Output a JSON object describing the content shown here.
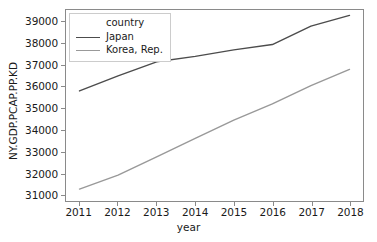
{
  "chart_data": {
    "type": "line",
    "title": "",
    "xlabel": "year",
    "ylabel": "NY.GDP.PCAP.PP.KD",
    "x": [
      2011,
      2012,
      2013,
      2014,
      2015,
      2016,
      2017,
      2018
    ],
    "xlim": [
      2010.65,
      2018.35
    ],
    "ylim": [
      30700,
      39550
    ],
    "xticks": [
      2011,
      2012,
      2013,
      2014,
      2015,
      2016,
      2017,
      2018
    ],
    "xtick_labels": [
      "2011",
      "2012",
      "2013",
      "2014",
      "2015",
      "2016",
      "2017",
      "2018"
    ],
    "yticks": [
      31000,
      32000,
      33000,
      34000,
      35000,
      36000,
      37000,
      38000,
      39000
    ],
    "ytick_labels": [
      "31000",
      "32000",
      "33000",
      "34000",
      "35000",
      "36000",
      "37000",
      "38000",
      "39000"
    ],
    "grid": false,
    "legend_position": "upper left",
    "legend_title": "country",
    "series": [
      {
        "name": "Japan",
        "color": "#4c4c4c",
        "values": [
          35800,
          36500,
          37150,
          37400,
          37700,
          37950,
          38800,
          39300
        ]
      },
      {
        "name": "Korea, Rep.",
        "color": "#999999",
        "values": [
          31250,
          31900,
          32750,
          33600,
          34450,
          35200,
          36050,
          36800
        ]
      }
    ]
  },
  "axes": {
    "frame_color": "#8a8a8a",
    "background": "#ffffff"
  }
}
